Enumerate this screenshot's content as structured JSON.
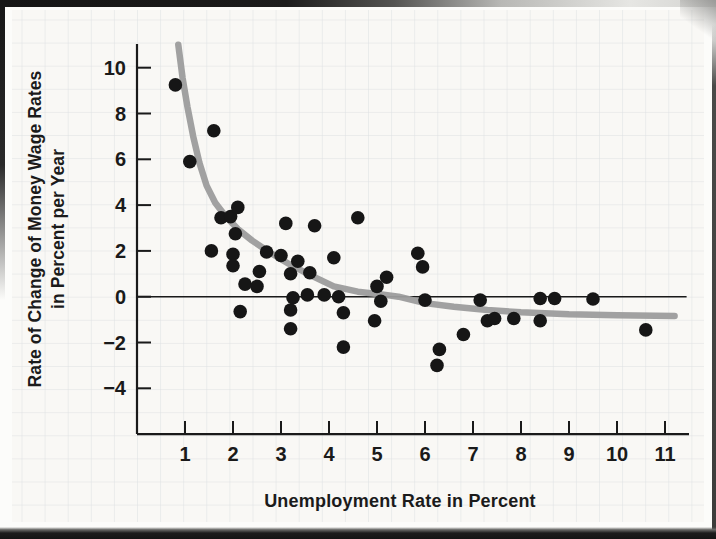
{
  "figure": {
    "xlabel": "Unemployment Rate in Percent",
    "ylabel_line1": "Rate of Change of Money Wage Rates",
    "ylabel_line2": "in Percent per Year"
  },
  "chart_data": {
    "type": "scatter",
    "title": "",
    "xlabel": "Unemployment Rate in Percent",
    "ylabel": "Rate of Change of Money Wage Rates in Percent per Year",
    "x_ticks": [
      1,
      2,
      3,
      4,
      5,
      6,
      7,
      8,
      9,
      10,
      11
    ],
    "y_ticks": [
      10,
      8,
      6,
      4,
      2,
      0,
      -2,
      -4
    ],
    "xlim": [
      0,
      11.5
    ],
    "ylim": [
      -6,
      11
    ],
    "grid": true,
    "legend_position": "none",
    "colors": {
      "points": "#161616",
      "curve": "#9c9c9c",
      "axis": "#1a1a1a",
      "grid": "#dde0e2",
      "paper": "#f9f8f5"
    },
    "series": [
      {
        "name": "observations",
        "points": [
          [
            0.8,
            9.25
          ],
          [
            1.1,
            5.9
          ],
          [
            1.6,
            7.25
          ],
          [
            1.55,
            2.0
          ],
          [
            1.75,
            3.45
          ],
          [
            1.95,
            3.5
          ],
          [
            2.1,
            3.9
          ],
          [
            2.05,
            2.75
          ],
          [
            2.0,
            1.85
          ],
          [
            2.0,
            1.35
          ],
          [
            2.15,
            -0.65
          ],
          [
            2.25,
            0.55
          ],
          [
            2.5,
            0.45
          ],
          [
            2.55,
            1.1
          ],
          [
            2.7,
            1.95
          ],
          [
            3.0,
            1.8
          ],
          [
            3.1,
            3.2
          ],
          [
            3.2,
            1.0
          ],
          [
            3.35,
            1.55
          ],
          [
            3.2,
            -0.58
          ],
          [
            3.2,
            -1.4
          ],
          [
            3.25,
            -0.05
          ],
          [
            3.55,
            0.08
          ],
          [
            3.6,
            1.05
          ],
          [
            3.7,
            3.1
          ],
          [
            3.9,
            0.08
          ],
          [
            4.1,
            1.7
          ],
          [
            4.2,
            0.0
          ],
          [
            4.3,
            -0.7
          ],
          [
            4.3,
            -2.2
          ],
          [
            4.6,
            3.45
          ],
          [
            4.95,
            -1.05
          ],
          [
            5.0,
            0.45
          ],
          [
            5.08,
            -0.2
          ],
          [
            5.2,
            0.85
          ],
          [
            5.85,
            1.9
          ],
          [
            5.95,
            1.3
          ],
          [
            6.0,
            -0.15
          ],
          [
            6.25,
            -3.0
          ],
          [
            6.3,
            -2.3
          ],
          [
            6.8,
            -1.65
          ],
          [
            7.15,
            -0.15
          ],
          [
            7.3,
            -1.05
          ],
          [
            7.45,
            -0.95
          ],
          [
            7.85,
            -0.95
          ],
          [
            8.4,
            -0.08
          ],
          [
            8.4,
            -1.05
          ],
          [
            8.7,
            -0.08
          ],
          [
            9.5,
            -0.1
          ],
          [
            10.6,
            -1.45
          ]
        ]
      },
      {
        "name": "fitted-phillips-curve",
        "points": [
          [
            0.86,
            11.0
          ],
          [
            0.95,
            9.55
          ],
          [
            1.05,
            8.3
          ],
          [
            1.17,
            7.0
          ],
          [
            1.3,
            5.85
          ],
          [
            1.45,
            4.85
          ],
          [
            1.63,
            4.1
          ],
          [
            1.85,
            3.5
          ],
          [
            2.1,
            2.95
          ],
          [
            2.4,
            2.45
          ],
          [
            2.75,
            1.95
          ],
          [
            3.15,
            1.45
          ],
          [
            3.6,
            0.95
          ],
          [
            4.1,
            0.45
          ],
          [
            4.6,
            0.22
          ],
          [
            5.1,
            0.1
          ],
          [
            5.45,
            0.0
          ],
          [
            6.0,
            -0.28
          ],
          [
            6.6,
            -0.44
          ],
          [
            7.3,
            -0.58
          ],
          [
            8.0,
            -0.68
          ],
          [
            9.0,
            -0.77
          ],
          [
            10.0,
            -0.81
          ],
          [
            11.2,
            -0.84
          ]
        ]
      }
    ],
    "zero_line": {
      "y": 0,
      "x_start": 0,
      "x_end": 11.45
    }
  }
}
